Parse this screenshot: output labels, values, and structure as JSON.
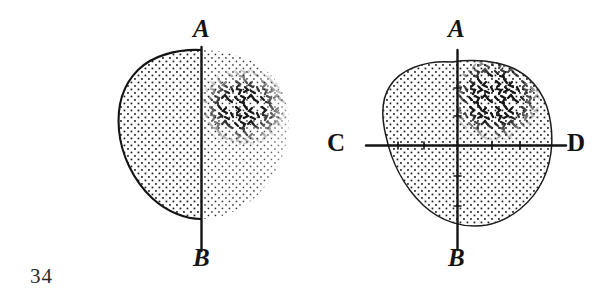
{
  "plate": {
    "number": "34",
    "background_color": "#ffffff",
    "ink_color": "#141414"
  },
  "figures": [
    {
      "id": "left",
      "name": "bisected-oval-half-outlined",
      "description": "Oval leaf-shaped outline divided by a vertical axis line; left half drawn with a solid contour and even stipple, right half unoutlined with stipple fading outward and a dense scribble patch in the upper right.",
      "axes": [
        {
          "id": "vertical",
          "top_label": "A",
          "bottom_label": "B",
          "has_ticks": false
        }
      ],
      "shading": {
        "left_half": "uniform-dot-stipple",
        "right_half": "fading-dot-stipple",
        "dense_patch": "scribble-dash-cluster",
        "dense_patch_location": "upper-right"
      }
    },
    {
      "id": "right",
      "name": "quartered-blob-crosshair",
      "description": "Rounded blob with a light continuous contour crossed by a vertical axis and a horizontal tick-marked axis, dividing it into four quadrants; stipple is even throughout and a dense scribble cluster fills the upper-right quadrant.",
      "axes": [
        {
          "id": "vertical",
          "top_label": "A",
          "bottom_label": "B",
          "has_ticks": true
        },
        {
          "id": "horizontal",
          "left_label": "C",
          "right_label": "D",
          "has_ticks": true
        }
      ],
      "shading": {
        "body": "uniform-dot-stipple",
        "dense_patch": "scribble-dash-cluster",
        "dense_patch_location": "upper-right-quadrant"
      }
    }
  ],
  "labels": {
    "left_top": "A",
    "left_bottom": "B",
    "right_top": "A",
    "right_bottom": "B",
    "right_left": "C",
    "right_right": "D"
  }
}
